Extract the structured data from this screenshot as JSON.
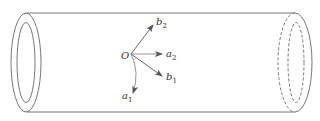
{
  "diagram": {
    "type": "cylindrical tube with vector basis",
    "stroke_color": "#777777",
    "arrow_color": "#555555",
    "origin": {
      "label": "O"
    },
    "vectors": [
      {
        "name": "b2",
        "label": "b",
        "subscript": "2"
      },
      {
        "name": "a2",
        "label": "a",
        "subscript": "2"
      },
      {
        "name": "b1",
        "label": "b",
        "subscript": "1"
      },
      {
        "name": "a1",
        "label": "a",
        "subscript": "1"
      }
    ]
  }
}
